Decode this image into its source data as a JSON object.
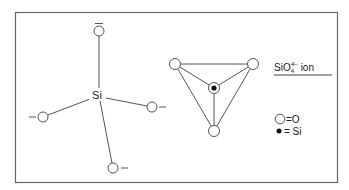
{
  "figure": {
    "frame": {
      "x": 15,
      "y": 12,
      "width": 323,
      "height": 171
    },
    "colors": {
      "stroke": "#555555",
      "frame": "#666666",
      "text": "#222222",
      "si_dot": "#111111",
      "background": "#ffffff"
    },
    "structural_formula": {
      "center_label": "Si",
      "center": {
        "x": 97,
        "y": 95
      },
      "oxygens": [
        {
          "id": "top",
          "x": 99,
          "y": 31,
          "charge": "−",
          "charge_pos": "above"
        },
        {
          "id": "left",
          "x": 43,
          "y": 117,
          "charge": "−",
          "charge_pos": "left"
        },
        {
          "id": "right",
          "x": 152,
          "y": 107,
          "charge": "−",
          "charge_pos": "right"
        },
        {
          "id": "bottom",
          "x": 113,
          "y": 168,
          "charge": "−",
          "charge_pos": "right"
        }
      ]
    },
    "tetrahedron": {
      "si": {
        "x": 214,
        "y": 88
      },
      "oxygens": [
        {
          "id": "top-left",
          "x": 175,
          "y": 64
        },
        {
          "id": "top-right",
          "x": 253,
          "y": 64
        },
        {
          "id": "bottom",
          "x": 214,
          "y": 131
        }
      ]
    },
    "title": {
      "base": "SiO",
      "subscript": "4",
      "superscript": "4−",
      "suffix": " ion"
    },
    "legend": {
      "items": [
        {
          "symbol": "open-circle",
          "label": "=O"
        },
        {
          "symbol": "filled-dot",
          "label": "= Si"
        }
      ]
    }
  }
}
